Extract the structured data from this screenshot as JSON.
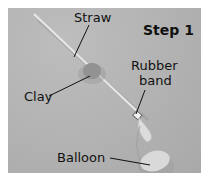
{
  "figure": {
    "step_title": "Step 1",
    "labels": {
      "straw": "Straw",
      "clay": "Clay",
      "rubber_band": [
        "Rubber",
        "band"
      ],
      "balloon": "Balloon"
    },
    "colors": {
      "background": "#b3b3b3",
      "text": "#111111",
      "straw": "#e6e6e6",
      "clay": "#8a8a8a",
      "balloon": "#d8d8d8"
    }
  }
}
